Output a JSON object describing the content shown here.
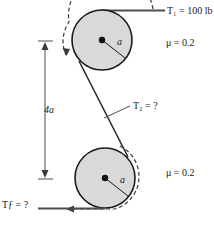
{
  "figure": {
    "labels": {
      "tension_top": "T₁ = 100 lb",
      "tension_middle": "T₂ = ?",
      "tension_bottom": "Tƒ = ?",
      "mu_top": "μ = 0.2",
      "mu_bottom": "μ = 0.2",
      "dimension": "4a",
      "radius_top": "a",
      "radius_bottom": "a"
    },
    "values": {
      "T1": "100 lb",
      "T2": "?",
      "Tf": "?",
      "mu": "0.2",
      "center_distance": "4a",
      "pulley_radius": "a"
    },
    "colors": {
      "pulley_fill": "#d9d9d9",
      "outline": "#1a1a1a",
      "belt": "#4d4d4d",
      "background": "#ffffff"
    },
    "geometry": {
      "upper_pulley": {
        "cx": 102,
        "cy": 40,
        "r": 30
      },
      "lower_pulley": {
        "cx": 105,
        "cy": 178,
        "r": 30
      }
    }
  }
}
